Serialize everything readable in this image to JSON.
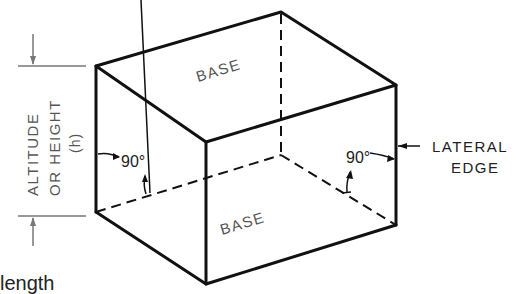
{
  "diagram": {
    "labels": {
      "top_base": "BASE",
      "bottom_base": "BASE",
      "altitude_line1": "ALTITUDE",
      "altitude_line2": "OR HEIGHT",
      "altitude_line3": "(h)",
      "angle_left": "90°",
      "angle_right": "90°",
      "lateral_line1": "LATERAL",
      "lateral_line2": "EDGE",
      "partial_caption": "length"
    },
    "colors": {
      "edge": "#111111",
      "text": "#555555",
      "dimension": "#777777"
    }
  }
}
